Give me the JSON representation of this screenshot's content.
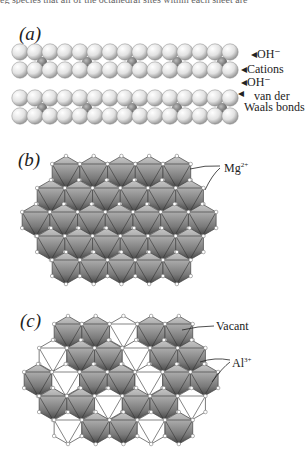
{
  "cut_text": "eg species that all of the octahedral sites within each sheet are",
  "panels": {
    "a": {
      "label": "(a)",
      "annotations": {
        "oh_top": "OH⁻",
        "cations": "Cations",
        "oh_bottom": "OH⁻",
        "vdw_line1": "van der",
        "vdw_line2": "Waals bonds"
      }
    },
    "b": {
      "label": "(b)",
      "annotations": {
        "mg": "Mg",
        "mg_charge": "2+"
      }
    },
    "c": {
      "label": "(c)",
      "annotations": {
        "vacant": "Vacant",
        "al": "Al",
        "al_charge": "3+"
      }
    }
  },
  "colors": {
    "sphere": "#e6e6e6",
    "octahedron_light": "#b9b9b9",
    "octahedron_dark": "#555555",
    "line": "#333333"
  }
}
